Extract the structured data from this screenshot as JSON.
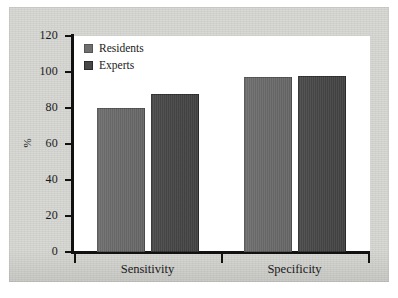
{
  "chart_data": {
    "type": "bar",
    "title": "",
    "subtitle": "",
    "xlabel": "",
    "ylabel": "%",
    "categories": [
      "Sensitivity",
      "Specificity"
    ],
    "series": [
      {
        "name": "Residents",
        "values": [
          80,
          97
        ],
        "color": "#6f6f6f"
      },
      {
        "name": "Experts",
        "values": [
          88,
          98
        ],
        "color": "#474747"
      }
    ],
    "ylim": [
      0,
      120
    ],
    "ytick_step": 20,
    "yticks": [
      0,
      20,
      40,
      60,
      80,
      100,
      120
    ],
    "ytick_labels": [
      "0",
      "20",
      "40",
      "60",
      "80",
      "100",
      "120"
    ],
    "grid": false,
    "legend_position": "top-left",
    "legend_entries": [
      "Residents",
      "Experts"
    ],
    "annotations": []
  },
  "figure": {
    "background_color": "#d8d8d5",
    "plot_background_color": "#ffffff",
    "axis_color": "#111111"
  }
}
